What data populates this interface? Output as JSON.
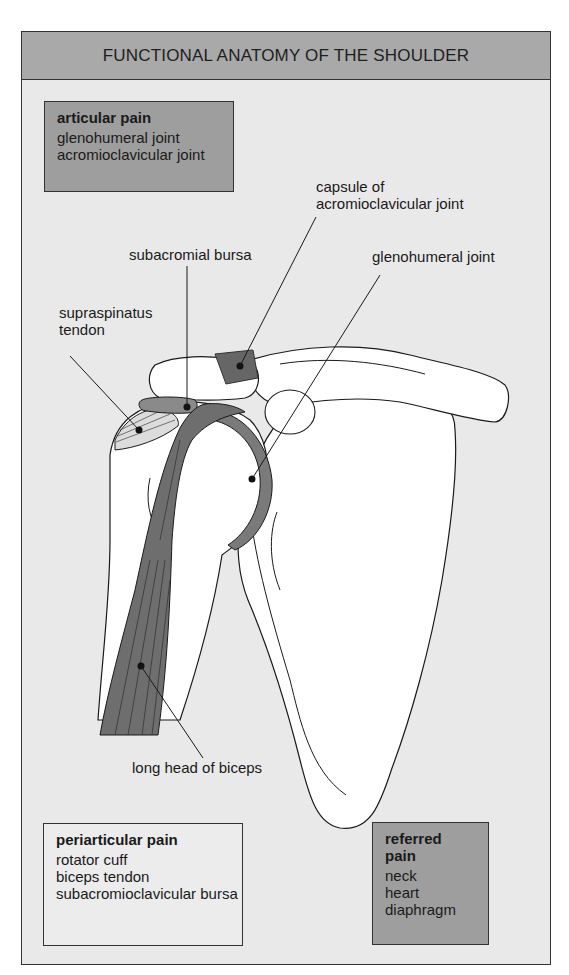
{
  "header": {
    "title": "FUNCTIONAL ANATOMY OF THE SHOULDER"
  },
  "boxes": {
    "articular": {
      "title": "articular pain",
      "items": [
        "glenohumeral joint",
        "acromioclavicular joint"
      ]
    },
    "periarticular": {
      "title": "periarticular pain",
      "items": [
        "rotator cuff",
        "biceps tendon",
        "subacromioclavicular bursa"
      ]
    },
    "referred": {
      "title": "referred pain",
      "items": [
        "neck",
        "heart",
        "diaphragm"
      ]
    }
  },
  "labels": {
    "capsule_line1": "capsule of",
    "capsule_line2": "acromioclavicular joint",
    "glenohumeral": "glenohumeral joint",
    "subacromial": "subacromial bursa",
    "supraspinatus_line1": "supraspinatus",
    "supraspinatus_line2": "tendon",
    "biceps": "long head of biceps"
  },
  "colors": {
    "background": "#e9e9e9",
    "header": "#a9a9a9",
    "dark_box": "#9e9e9e",
    "structure": "#6e6e6e",
    "bone": "#ffffff"
  }
}
